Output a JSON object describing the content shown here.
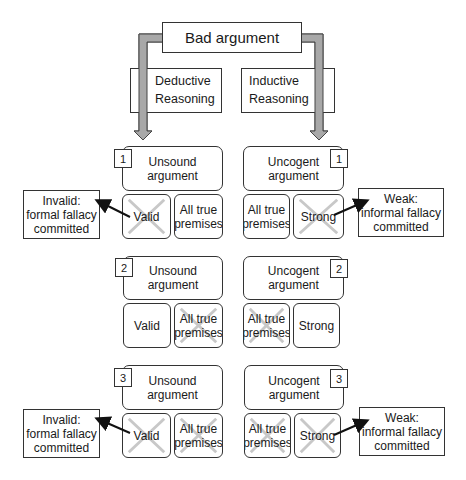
{
  "diagram": {
    "root": {
      "label": "Bad argument"
    },
    "branches": {
      "deductive": {
        "line1": "Deductive",
        "line2": "Reasoning"
      },
      "inductive": {
        "line1": "Inductive",
        "line2": "Reasoning"
      }
    },
    "deductive_cases": [
      {
        "number": "1",
        "title_line1": "Unsound",
        "title_line2": "argument",
        "cells": [
          {
            "line1": "Valid",
            "line2": "",
            "crossed": true
          },
          {
            "line1": "All true",
            "line2": "premises",
            "crossed": false
          }
        ],
        "note": {
          "line1": "Invalid:",
          "line2": "formal fallacy",
          "line3": "committed"
        }
      },
      {
        "number": "2",
        "title_line1": "Unsound",
        "title_line2": "argument",
        "cells": [
          {
            "line1": "Valid",
            "line2": "",
            "crossed": false
          },
          {
            "line1": "All true",
            "line2": "premises",
            "crossed": true
          }
        ]
      },
      {
        "number": "3",
        "title_line1": "Unsound",
        "title_line2": "argument",
        "cells": [
          {
            "line1": "Valid",
            "line2": "",
            "crossed": true
          },
          {
            "line1": "All true",
            "line2": "premises",
            "crossed": true
          }
        ],
        "note": {
          "line1": "Invalid:",
          "line2": "formal fallacy",
          "line3": "committed"
        }
      }
    ],
    "inductive_cases": [
      {
        "number": "1",
        "title_line1": "Uncogent",
        "title_line2": "argument",
        "cells": [
          {
            "line1": "All true",
            "line2": "premises",
            "crossed": false
          },
          {
            "line1": "Strong",
            "line2": "",
            "crossed": true
          }
        ],
        "note": {
          "line1": "Weak:",
          "line2": "informal fallacy",
          "line3": "committed"
        }
      },
      {
        "number": "2",
        "title_line1": "Uncogent",
        "title_line2": "argument",
        "cells": [
          {
            "line1": "All true",
            "line2": "premises",
            "crossed": true
          },
          {
            "line1": "Strong",
            "line2": "",
            "crossed": false
          }
        ]
      },
      {
        "number": "3",
        "title_line1": "Uncogent",
        "title_line2": "argument",
        "cells": [
          {
            "line1": "All true",
            "line2": "premises",
            "crossed": true
          },
          {
            "line1": "Strong",
            "line2": "",
            "crossed": true
          }
        ],
        "note": {
          "line1": "Weak:",
          "line2": "informal fallacy",
          "line3": "committed"
        }
      }
    ],
    "colors": {
      "arrow_fill": "#a8a8a8",
      "stroke": "#333333",
      "cross": "#c8c8c8"
    }
  }
}
